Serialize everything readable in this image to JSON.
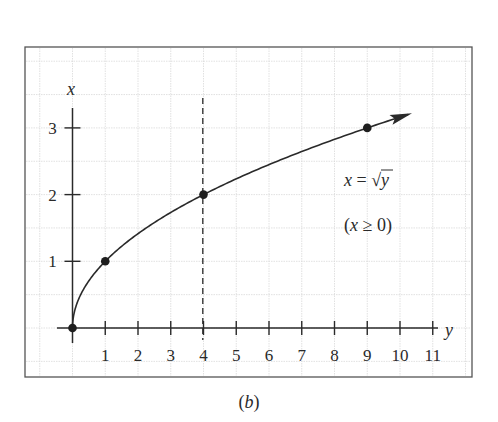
{
  "chart_data": {
    "type": "line",
    "title": "",
    "function": "x = sqrt(y)",
    "xlabel": "y",
    "ylabel": "x",
    "xlim": [
      0,
      11
    ],
    "ylim": [
      0,
      3
    ],
    "x_ticks": [
      1,
      2,
      3,
      4,
      5,
      6,
      7,
      8,
      9,
      10,
      11
    ],
    "y_ticks": [
      1,
      2,
      3
    ],
    "grid": true,
    "series": [
      {
        "name": "x = √y",
        "curve_x": [
          0,
          0.25,
          0.5,
          1,
          2,
          3,
          4,
          5,
          6,
          7,
          8,
          9,
          10
        ],
        "curve_y": [
          0,
          0.5,
          0.707,
          1,
          1.414,
          1.732,
          2,
          2.236,
          2.449,
          2.646,
          2.828,
          3,
          3.162
        ],
        "marked_points": [
          {
            "y": 0,
            "x": 0
          },
          {
            "y": 1,
            "x": 1
          },
          {
            "y": 4,
            "x": 2
          },
          {
            "y": 9,
            "x": 3
          }
        ],
        "arrow_end": true
      }
    ],
    "reference_lines": [
      {
        "type": "vertical",
        "at": 4,
        "style": "dashed"
      }
    ],
    "annotations": [
      {
        "text": "x = √y",
        "position": [
          9.6,
          2
        ]
      },
      {
        "text": "(x ≥ 0)",
        "position": [
          9.6,
          1.5
        ]
      }
    ]
  },
  "labels": {
    "axis_x_name": "y",
    "axis_y_name": "x",
    "x_tick_labels": [
      "1",
      "2",
      "3",
      "4",
      "5",
      "6",
      "7",
      "8",
      "9",
      "10",
      "11"
    ],
    "y_tick_labels": [
      "1",
      "2",
      "3"
    ],
    "equation_lhs": "x = ",
    "equation_radicand": "y",
    "equation_sqrt": "√",
    "condition": "(x ≥ 0)",
    "caption": "(b)"
  },
  "colors": {
    "ink": "#2a2a2a",
    "grid": "#d8d8d8",
    "frame": "#555555",
    "background": "#ffffff"
  }
}
